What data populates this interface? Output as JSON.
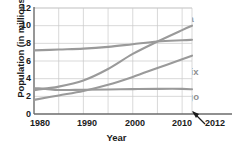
{
  "chart_data": {
    "type": "line",
    "title": "",
    "xlabel": "Year",
    "ylabel": "Population (in millions)",
    "xlim": [
      1980,
      2012
    ],
    "ylim": [
      0,
      12
    ],
    "grid": true,
    "legend_position": "inline-labels",
    "xticks": [
      "1980",
      "1990",
      "2000",
      "2010",
      "2012"
    ],
    "yticks": [
      "0",
      "2",
      "4",
      "6",
      "8",
      "10",
      "12"
    ],
    "annotations": [
      {
        "name": "arrow-to-2012",
        "text": "2012",
        "points_to_x": 2012
      }
    ],
    "series": [
      {
        "name": "New York",
        "color": "#9a9a9a",
        "label_x": 1990,
        "label_y": 8.6,
        "x": [
          1980,
          1985,
          1990,
          1995,
          2000,
          2005,
          2010,
          2012
        ],
        "values": [
          7.2,
          7.3,
          7.4,
          7.6,
          7.9,
          8.2,
          8.35,
          8.4
        ]
      },
      {
        "name": "Atlanta",
        "color": "#9a9a9a",
        "label_x": 2005,
        "label_y": 11.1,
        "x": [
          1980,
          1985,
          1990,
          1995,
          2000,
          2005,
          2010,
          2012
        ],
        "values": [
          2.7,
          3.1,
          3.8,
          5.1,
          6.8,
          8.2,
          9.5,
          10.0
        ]
      },
      {
        "name": "Phoenix",
        "color": "#9a9a9a",
        "label_x": 2005,
        "label_y": 4.9,
        "x": [
          1980,
          1985,
          1990,
          1995,
          2000,
          2005,
          2010,
          2012
        ],
        "values": [
          1.6,
          2.1,
          2.6,
          3.3,
          4.2,
          5.2,
          6.2,
          6.6
        ]
      },
      {
        "name": "Chicago",
        "color": "#9a9a9a",
        "label_x": 2005,
        "label_y": 1.9,
        "x": [
          1980,
          1985,
          1990,
          1995,
          2000,
          2005,
          2010,
          2012
        ],
        "values": [
          2.95,
          2.72,
          2.75,
          2.78,
          2.82,
          2.85,
          2.85,
          2.8
        ]
      }
    ]
  },
  "axes": {
    "y_title": "Population (in millions)",
    "x_title": "Year",
    "y_ticks": [
      {
        "label": "12",
        "value": 12
      },
      {
        "label": "10",
        "value": 10
      },
      {
        "label": "8",
        "value": 8
      },
      {
        "label": "6",
        "value": 6
      },
      {
        "label": "4",
        "value": 4
      },
      {
        "label": "2",
        "value": 2
      },
      {
        "label": "0",
        "value": 0
      }
    ],
    "x_ticks": [
      {
        "label": "1980",
        "value": 1980
      },
      {
        "label": "1990",
        "value": 1990
      },
      {
        "label": "2000",
        "value": 2000
      },
      {
        "label": "2010",
        "value": 2010
      }
    ],
    "x_end_label": "2012"
  },
  "style": {
    "line_color": "#9a9a9a",
    "grid_color": "#c9c9c9",
    "axis_color": "#6b6b6b",
    "text_color": "#1b1b1b",
    "series_label_color": "#8f8f8f",
    "background": "#ffffff"
  }
}
